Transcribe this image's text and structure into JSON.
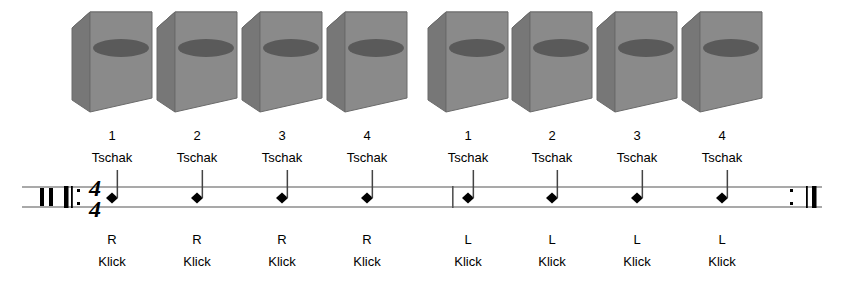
{
  "figure": {
    "background_color": "#ffffff",
    "ink_color": "#000000"
  },
  "instrument_row": {
    "icon_name": "cajon-box-icon",
    "count": 8,
    "instrument_label": "cajon",
    "colors": {
      "front_face": "#8a8a8a",
      "side_face": "#777777",
      "top_face": "#9a9a9a",
      "sound_hole": "#5a5a5a",
      "outline": "#6b6b6b"
    },
    "boxes": [
      {
        "x": 112
      },
      {
        "x": 197
      },
      {
        "x": 282
      },
      {
        "x": 367
      },
      {
        "x": 468
      },
      {
        "x": 552
      },
      {
        "x": 637
      },
      {
        "x": 722
      }
    ]
  },
  "notation": {
    "clef": "percussion-clef",
    "time_signature": {
      "numerator": "4",
      "denominator": "4"
    },
    "staff_lines": 2,
    "start_barline": "repeat-start",
    "end_barline": "repeat-end",
    "middle_barline": "single",
    "notehead_style": "diamond",
    "stem_direction": "up",
    "measures": [
      {
        "index": 1,
        "beats": [
          {
            "number": "1",
            "above": "Tschak",
            "hand": "R",
            "below": "Klick",
            "x": 112
          },
          {
            "number": "2",
            "above": "Tschak",
            "hand": "R",
            "below": "Klick",
            "x": 197
          },
          {
            "number": "3",
            "above": "Tschak",
            "hand": "R",
            "below": "Klick",
            "x": 282
          },
          {
            "number": "4",
            "above": "Tschak",
            "hand": "R",
            "below": "Klick",
            "x": 367
          }
        ]
      },
      {
        "index": 2,
        "beats": [
          {
            "number": "1",
            "above": "Tschak",
            "hand": "L",
            "below": "Klick",
            "x": 468
          },
          {
            "number": "2",
            "above": "Tschak",
            "hand": "L",
            "below": "Klick",
            "x": 552
          },
          {
            "number": "3",
            "above": "Tschak",
            "hand": "L",
            "below": "Klick",
            "x": 637
          },
          {
            "number": "4",
            "above": "Tschak",
            "hand": "L",
            "below": "Klick",
            "x": 722
          }
        ]
      }
    ]
  },
  "labels": {
    "beat_numbers": [
      "1",
      "2",
      "3",
      "4",
      "1",
      "2",
      "3",
      "4"
    ],
    "above_notes": [
      "Tschak",
      "Tschak",
      "Tschak",
      "Tschak",
      "Tschak",
      "Tschak",
      "Tschak",
      "Tschak"
    ],
    "hands": [
      "R",
      "R",
      "R",
      "R",
      "L",
      "L",
      "L",
      "L"
    ],
    "below_notes": [
      "Klick",
      "Klick",
      "Klick",
      "Klick",
      "Klick",
      "Klick",
      "Klick",
      "Klick"
    ],
    "time_sig_top": "4",
    "time_sig_bottom": "4"
  }
}
